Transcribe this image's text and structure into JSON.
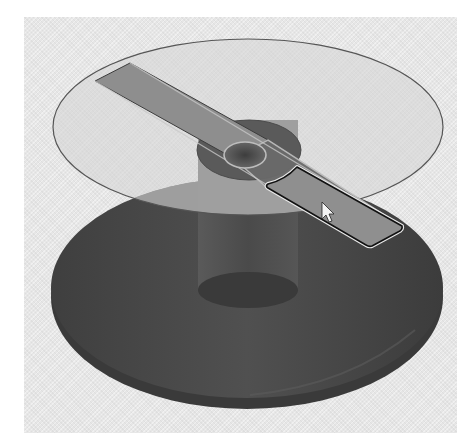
{
  "viewport": {
    "label": "3D model viewport",
    "background": "#e6e6e6"
  },
  "model": {
    "name": "disk-on-post assembly",
    "parts": [
      {
        "id": "base",
        "label": "Base cylinder",
        "color": "#4a4a4a"
      },
      {
        "id": "post",
        "label": "Center post",
        "color": "#585858"
      },
      {
        "id": "disk",
        "label": "Transparent top disk",
        "color": "#d2d2d2"
      },
      {
        "id": "slot-bar",
        "label": "Slot bar",
        "color": "#8c8c8c"
      },
      {
        "id": "hub-circle",
        "label": "Hub circle",
        "color": "#6a6a6a"
      }
    ],
    "selected_face": {
      "label": "Selected face",
      "highlight_color": "#8f8f8f",
      "outline_color": "#111111"
    }
  },
  "cursor": {
    "type": "arrow-pointer",
    "x": 322,
    "y": 202
  }
}
